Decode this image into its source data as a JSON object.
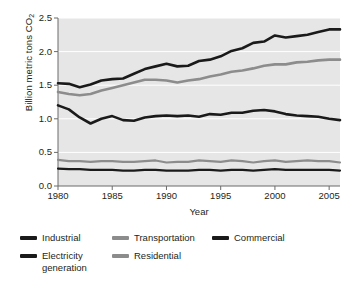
{
  "chart_data": {
    "type": "line",
    "title": "",
    "xlabel": "Year",
    "ylabel": "Billion metric tons CO2",
    "ylabel_display": "Billion metric tons CO",
    "ylabel_subscript": "2",
    "xlim": [
      1980,
      2006
    ],
    "ylim": [
      0.0,
      2.5
    ],
    "grid": true,
    "grid_color": "#ffffff",
    "plot_background": "#e6e6e6",
    "legend_position": "below",
    "xticks": [
      1980,
      1985,
      1990,
      1995,
      2000,
      2005
    ],
    "xtick_labels": [
      "1980",
      "1985",
      "1990",
      "1995",
      "2000",
      "2005"
    ],
    "yticks": [
      0.0,
      0.5,
      1.0,
      1.5,
      2.0,
      2.5
    ],
    "ytick_labels": [
      "0.0",
      "0.5",
      "1.0",
      "1.5",
      "2.0",
      "2.5"
    ],
    "x": [
      1980,
      1981,
      1982,
      1983,
      1984,
      1985,
      1986,
      1987,
      1988,
      1989,
      1990,
      1991,
      1992,
      1993,
      1994,
      1995,
      1996,
      1997,
      1998,
      1999,
      2000,
      2001,
      2002,
      2003,
      2004,
      2005,
      2006
    ],
    "series": [
      {
        "name": "Electricity generation",
        "color": "#1a1a1a",
        "width": 2.6,
        "values": [
          1.53,
          1.52,
          1.47,
          1.51,
          1.57,
          1.59,
          1.6,
          1.67,
          1.74,
          1.78,
          1.82,
          1.78,
          1.79,
          1.86,
          1.88,
          1.93,
          2.01,
          2.05,
          2.13,
          2.15,
          2.24,
          2.21,
          2.23,
          2.25,
          2.29,
          2.33,
          2.33
        ]
      },
      {
        "name": "Transportation",
        "color": "#8c8c8c",
        "width": 2.6,
        "values": [
          1.4,
          1.37,
          1.35,
          1.37,
          1.42,
          1.46,
          1.5,
          1.54,
          1.58,
          1.58,
          1.57,
          1.54,
          1.57,
          1.59,
          1.63,
          1.66,
          1.7,
          1.72,
          1.75,
          1.79,
          1.81,
          1.81,
          1.84,
          1.85,
          1.87,
          1.88,
          1.88
        ]
      },
      {
        "name": "Industrial",
        "color": "#1a1a1a",
        "width": 2.6,
        "values": [
          1.2,
          1.14,
          1.02,
          0.93,
          1.0,
          1.04,
          0.98,
          0.97,
          1.02,
          1.04,
          1.05,
          1.04,
          1.05,
          1.03,
          1.07,
          1.06,
          1.09,
          1.09,
          1.12,
          1.13,
          1.11,
          1.07,
          1.05,
          1.04,
          1.03,
          1.0,
          0.98
        ]
      },
      {
        "name": "Residential",
        "color": "#8c8c8c",
        "width": 2.2,
        "values": [
          0.39,
          0.37,
          0.37,
          0.36,
          0.37,
          0.37,
          0.36,
          0.36,
          0.37,
          0.38,
          0.35,
          0.36,
          0.36,
          0.38,
          0.37,
          0.36,
          0.38,
          0.37,
          0.35,
          0.37,
          0.38,
          0.36,
          0.37,
          0.38,
          0.37,
          0.37,
          0.35
        ]
      },
      {
        "name": "Commercial",
        "color": "#1a1a1a",
        "width": 2.2,
        "values": [
          0.26,
          0.25,
          0.25,
          0.24,
          0.24,
          0.24,
          0.23,
          0.23,
          0.24,
          0.24,
          0.23,
          0.23,
          0.23,
          0.24,
          0.24,
          0.23,
          0.24,
          0.24,
          0.23,
          0.24,
          0.25,
          0.24,
          0.24,
          0.24,
          0.24,
          0.24,
          0.23
        ]
      }
    ]
  },
  "axes": {
    "ylabel_main": "Billion metric tons CO",
    "ylabel_sub": "2",
    "xlabel": "Year"
  },
  "legend": {
    "items": [
      {
        "label": "Industrial",
        "color": "#1a1a1a",
        "col": 0,
        "row": 0
      },
      {
        "label": "Transportation",
        "color": "#8c8c8c",
        "col": 1,
        "row": 0
      },
      {
        "label": "Commercial",
        "color": "#1a1a1a",
        "col": 2,
        "row": 0
      },
      {
        "label": "Electricity\ngeneration",
        "color": "#1a1a1a",
        "col": 0,
        "row": 1
      },
      {
        "label": "Residential",
        "color": "#8c8c8c",
        "col": 1,
        "row": 1
      }
    ]
  }
}
